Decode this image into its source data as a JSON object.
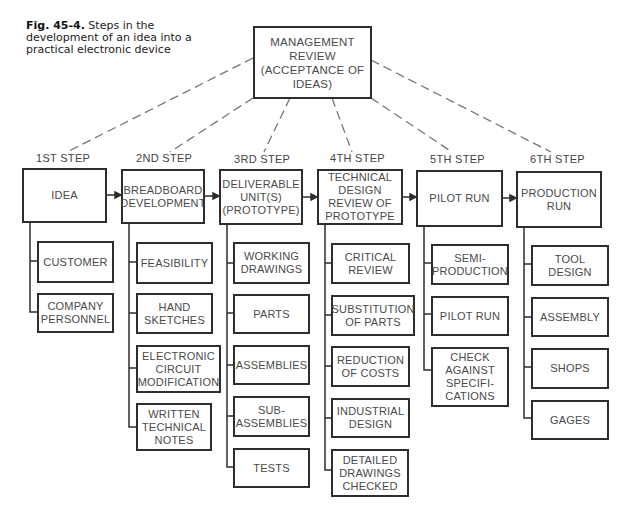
{
  "caption": {
    "figure_label": "Fig. 45-4.",
    "text": " Steps in the development of an idea into a practical electronic device"
  },
  "management_box": {
    "label": "MANAGEMENT\nREVIEW\n(ACCEPTANCE OF\nIDEAS)"
  },
  "steps": [
    {
      "step_label": "1ST STEP",
      "title": "IDEA",
      "sub": [
        "CUSTOMER",
        "COMPANY\nPERSONNEL"
      ]
    },
    {
      "step_label": "2ND STEP",
      "title": "BREADBOARD\nDEVELOPMENT",
      "sub": [
        "FEASIBILITY",
        "HAND\nSKETCHES",
        "ELECTRONIC\nCIRCUIT\nMODIFICATION",
        "WRITTEN\nTECHNICAL\nNOTES"
      ]
    },
    {
      "step_label": "3RD STEP",
      "title": "DELIVERABLE\nUNIT(S)\n(PROTOTYPE)",
      "sub": [
        "WORKING\nDRAWINGS",
        "PARTS",
        "ASSEMBLIES",
        "SUB-\nASSEMBLIES",
        "TESTS"
      ]
    },
    {
      "step_label": "4TH STEP",
      "title": "TECHNICAL\nDESIGN\nREVIEW OF\nPROTOTYPE",
      "sub": [
        "CRITICAL\nREVIEW",
        "SUBSTITUTION\nOF PARTS",
        "REDUCTION\nOF COSTS",
        "INDUSTRIAL\nDESIGN",
        "DETAILED\nDRAWINGS\nCHECKED"
      ]
    },
    {
      "step_label": "5TH STEP",
      "title": "PILOT RUN",
      "sub": [
        "SEMI-\nPRODUCTION",
        "PILOT RUN",
        "CHECK\nAGAINST\nSPECIFI-\nCATIONS"
      ]
    },
    {
      "step_label": "6TH STEP",
      "title": "PRODUCTION\nRUN",
      "sub": [
        "TOOL\nDESIGN",
        "ASSEMBLY",
        "SHOPS",
        "GAGES"
      ]
    }
  ],
  "colors": {
    "line": "#2e2e2e",
    "dash": "#777777",
    "text": "#4a4a4a"
  }
}
